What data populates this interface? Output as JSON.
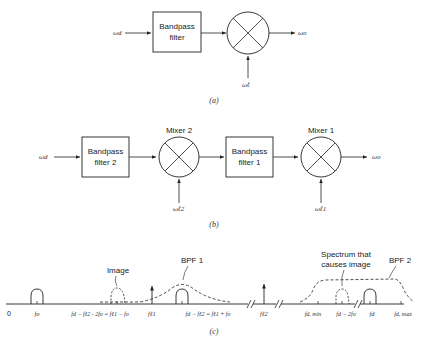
{
  "diagram_a": {
    "input_label": "ωd",
    "filter_label_line1": "Bandpass",
    "filter_label_line2": "filter",
    "output_label": "ωo",
    "lo_label": "ωℓ",
    "caption": "(a)"
  },
  "diagram_b": {
    "input_label": "ωd",
    "filter2_line1": "Bandpass",
    "filter2_line2": "filter 2",
    "mixer2_label": "Mixer 2",
    "filter1_line1": "Bandpass",
    "filter1_line2": "filter 1",
    "mixer1_label": "Mixer 1",
    "output_label": "ωo",
    "lo2_label": "ωℓ2",
    "lo1_label": "ωℓ1",
    "caption": "(b)"
  },
  "diagram_c": {
    "annotations": {
      "image": "Image",
      "bpf1": "BPF 1",
      "spectrum_line1": "Spectrum that",
      "spectrum_line2": "causes image",
      "bpf2": "BPF 2"
    },
    "axis_labels": {
      "zero": "0",
      "fo": "fo",
      "image_freq": "fd − fℓ2 - 2fo = fℓ1 − fo",
      "fl1": "fℓ1",
      "if_freq": "fd − fℓ2 = fℓ1 + fo",
      "fl2": "fℓ2",
      "fd_min": "fd, min",
      "fd_minus_2fo": "fd − 2fo",
      "fd": "fd",
      "fd_max": "fd, max"
    },
    "caption": "(c)"
  }
}
